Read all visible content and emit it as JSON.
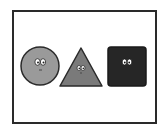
{
  "scene": {
    "shapes": [
      {
        "kind": "circle",
        "fill": "#9a9a9a",
        "stroke": "#2a2a2a",
        "face": "eyes-and-mouth"
      },
      {
        "kind": "triangle",
        "fill": "#7a7a7a",
        "stroke": "#2a2a2a",
        "face": "eyes-and-mouth"
      },
      {
        "kind": "square",
        "fill": "#262626",
        "stroke": "#1a1a1a",
        "face": "eyes"
      }
    ],
    "frame_color": "#2a2a2a"
  }
}
